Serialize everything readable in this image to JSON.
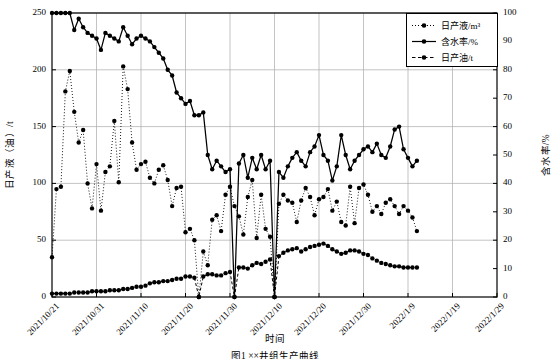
{
  "figure": {
    "caption": "图1  ××井组生产曲线"
  },
  "chart_data": {
    "type": "line",
    "title": "",
    "xlabel": "时间",
    "ylabel": "日产液（油）/t",
    "y2label": "含水率/%",
    "ylim": [
      0,
      250
    ],
    "y2lim": [
      0,
      100
    ],
    "yticks": [
      0,
      50,
      100,
      150,
      200,
      250
    ],
    "y2ticks": [
      0,
      10,
      20,
      30,
      40,
      50,
      60,
      70,
      80,
      90,
      100
    ],
    "grid": true,
    "legend_position": "top-right",
    "x_tick_labels": [
      "2021/10/21",
      "2021/10/31",
      "2021/11/10",
      "2021/11/20",
      "2021/11/30",
      "2021/12/10",
      "2021/12/20",
      "2021/12/30",
      "2022/1/9",
      "2022/1/19",
      "2022/1/29"
    ],
    "x_start_day": 0,
    "x_end_day": 100,
    "x": [
      0,
      1,
      2,
      3,
      4,
      5,
      6,
      7,
      8,
      9,
      10,
      11,
      12,
      13,
      14,
      15,
      16,
      17,
      18,
      19,
      20,
      21,
      22,
      23,
      24,
      25,
      26,
      27,
      28,
      29,
      30,
      31,
      32,
      33,
      34,
      35,
      36,
      37,
      38,
      39,
      40,
      41,
      42,
      43,
      44,
      45,
      46,
      47,
      48,
      49,
      50,
      51,
      52,
      53,
      54,
      55,
      56,
      57,
      58,
      59,
      60,
      61,
      62,
      63,
      64,
      65,
      66,
      67,
      68,
      69,
      70,
      71,
      72,
      73,
      74,
      75,
      76,
      77,
      78,
      79,
      80,
      81,
      82
    ],
    "series": [
      {
        "name": "日产液/m³",
        "axis": "left",
        "style": "dotted",
        "marker": "circle",
        "color": "#000000",
        "values": [
          35,
          95,
          97,
          181,
          199,
          163,
          136,
          147,
          100,
          78,
          117,
          76,
          110,
          115,
          155,
          101,
          203,
          183,
          136,
          112,
          117,
          119,
          105,
          100,
          112,
          116,
          103,
          80,
          96,
          97,
          57,
          60,
          50,
          0,
          40,
          28,
          68,
          72,
          58,
          90,
          97,
          80,
          71,
          55,
          88,
          103,
          52,
          90,
          60,
          53,
          0,
          82,
          90,
          85,
          83,
          66,
          85,
          96,
          88,
          72,
          86,
          88,
          95,
          76,
          84,
          66,
          63,
          97,
          65,
          96,
          99,
          90,
          75,
          80,
          73,
          83,
          86,
          80,
          73,
          80,
          76,
          70,
          58
        ]
      },
      {
        "name": "含水率/%",
        "axis": "right",
        "style": "solid",
        "marker": "circle",
        "color": "#000000",
        "values": [
          100,
          100,
          100,
          100,
          100,
          94,
          98,
          95,
          93,
          92,
          91,
          87,
          93,
          92,
          91,
          90,
          95,
          92,
          89,
          91,
          92,
          91,
          90,
          88,
          86,
          84,
          80,
          78,
          72,
          70,
          68,
          69,
          64,
          64,
          65,
          50,
          45,
          48,
          46,
          44,
          45,
          0,
          47,
          50,
          42,
          49,
          45,
          50,
          45,
          48,
          0,
          44,
          42,
          46,
          49,
          51,
          48,
          46,
          51,
          53,
          57,
          50,
          48,
          41,
          46,
          57,
          50,
          45,
          48,
          50,
          52,
          53,
          51,
          54,
          50,
          49,
          53,
          59,
          60,
          52,
          49,
          46,
          48
        ]
      },
      {
        "name": "日产油/t",
        "axis": "left",
        "style": "dashed",
        "marker": "circle",
        "color": "#000000",
        "values": [
          3,
          3,
          3,
          3,
          3,
          4,
          4,
          4,
          4,
          5,
          5,
          5,
          5,
          6,
          6,
          6,
          7,
          7,
          8,
          9,
          9,
          10,
          12,
          13,
          13,
          14,
          14,
          15,
          16,
          16,
          18,
          18,
          17,
          0,
          18,
          20,
          20,
          19,
          19,
          21,
          22,
          0,
          26,
          26,
          25,
          28,
          30,
          29,
          31,
          33,
          0,
          36,
          39,
          41,
          42,
          43,
          40,
          42,
          44,
          45,
          46,
          47,
          45,
          42,
          40,
          38,
          39,
          41,
          41,
          40,
          38,
          37,
          34,
          32,
          30,
          29,
          28,
          27,
          27,
          26,
          26,
          26,
          26
        ]
      }
    ]
  },
  "legend": {
    "items": [
      {
        "label": "日产液/m³",
        "style": "dotted"
      },
      {
        "label": "含水率/%",
        "style": "solid"
      },
      {
        "label": "日产油/t",
        "style": "dashed"
      }
    ]
  }
}
